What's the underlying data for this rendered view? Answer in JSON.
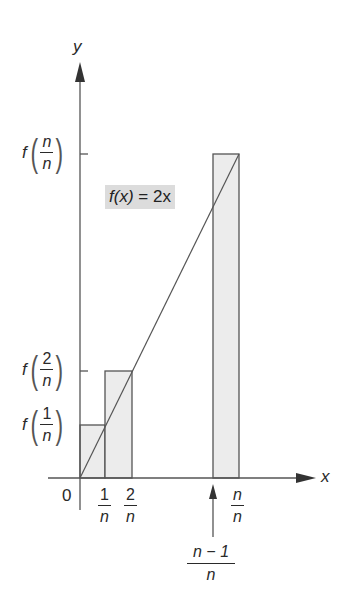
{
  "diagram": {
    "type": "riemann-sum-right-endpoint",
    "function_label": {
      "lhs": "f(x)",
      "eq": "=",
      "rhs": "2x"
    },
    "axes": {
      "x_label": "x",
      "y_label": "y",
      "origin_label": "0"
    },
    "x_ticks": [
      {
        "num": "1",
        "den": "n"
      },
      {
        "num": "2",
        "den": "n"
      },
      {
        "num": "n",
        "den": "n"
      }
    ],
    "x_pointer_label": {
      "num": "n − 1",
      "den": "n"
    },
    "y_ticks": [
      {
        "fn": "f",
        "num": "1",
        "den": "n"
      },
      {
        "fn": "f",
        "num": "2",
        "den": "n"
      },
      {
        "fn": "f",
        "num": "n",
        "den": "n"
      }
    ],
    "rectangles": [
      {
        "x_from": "0",
        "x_to": "1/n",
        "height": "f(1/n)"
      },
      {
        "x_from": "1/n",
        "x_to": "2/n",
        "height": "f(2/n)"
      },
      {
        "x_from": "(n-1)/n",
        "x_to": "n/n",
        "height": "f(n/n)"
      }
    ],
    "colors": {
      "line": "#555555",
      "rect_fill": "#ececec",
      "label_box": "#dcdcdc"
    }
  }
}
